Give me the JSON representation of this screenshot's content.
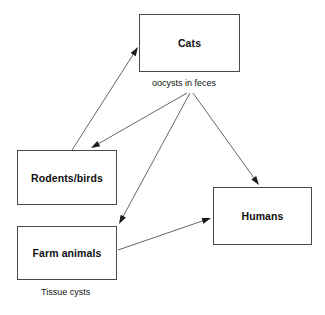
{
  "diagram": {
    "width": 325,
    "height": 315,
    "background_color": "#ffffff",
    "line_color": "#555555",
    "border_color": "#4a4a4a",
    "text_color": "#111111",
    "nodes": [
      {
        "id": "cats",
        "label": "Cats",
        "x": 139,
        "y": 14,
        "w": 101,
        "h": 58
      },
      {
        "id": "rodents_birds",
        "label": "Rodents/birds",
        "x": 17,
        "y": 150,
        "w": 100,
        "h": 55
      },
      {
        "id": "farm_animals",
        "label": "Farm animals",
        "x": 17,
        "y": 226,
        "w": 100,
        "h": 54
      },
      {
        "id": "humans",
        "label": "Humans",
        "x": 213,
        "y": 187,
        "w": 99,
        "h": 58
      }
    ],
    "captions": [
      {
        "id": "oocysts",
        "text": "oocysts in feces",
        "x": 152,
        "y": 78
      },
      {
        "id": "tissue_cysts",
        "text": "Tissue cysts",
        "x": 41,
        "y": 287
      }
    ],
    "edges": [
      {
        "id": "rodents-to-cats",
        "from": "rodents_birds",
        "to": "cats",
        "x1": 72,
        "y1": 150,
        "x2": 138,
        "y2": 47
      },
      {
        "id": "oocysts-to-rodents",
        "from": "oocysts",
        "to": "rodents_birds",
        "x1": 187,
        "y1": 93,
        "x2": 91,
        "y2": 148
      },
      {
        "id": "oocysts-to-farm",
        "from": "oocysts",
        "to": "farm_animals",
        "x1": 190,
        "y1": 93,
        "x2": 119,
        "y2": 224
      },
      {
        "id": "oocysts-to-humans",
        "from": "oocysts",
        "to": "humans",
        "x1": 193,
        "y1": 93,
        "x2": 259,
        "y2": 185
      },
      {
        "id": "farm-to-humans",
        "from": "farm_animals",
        "to": "humans",
        "x1": 118,
        "y1": 250,
        "x2": 211,
        "y2": 218
      }
    ]
  }
}
